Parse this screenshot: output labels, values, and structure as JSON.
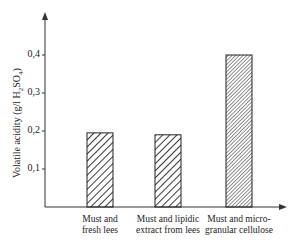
{
  "chart_data": {
    "type": "bar",
    "title": "",
    "xlabel": "",
    "ylabel": "Volatile acidity (g/l H2SO4)",
    "ylabel_parts": {
      "main": "Volatile acidity (g/l H",
      "sub1": "2",
      "mid": "SO",
      "sub2": "4",
      "end": ")"
    },
    "categories": [
      "Must and fresh lees",
      "Must and lipidic extract from lees",
      "Must and micro-granular cellulose"
    ],
    "category_lines": [
      [
        "Must and",
        "fresh lees"
      ],
      [
        "Must and lipidic",
        "extract from lees"
      ],
      [
        "Must and micro-",
        "granular cellulose"
      ]
    ],
    "values": [
      0.195,
      0.19,
      0.4
    ],
    "yticks": [
      "0,1",
      "0,2",
      "0,3",
      "0,4"
    ],
    "ytick_values": [
      0.1,
      0.2,
      0.3,
      0.4
    ],
    "ylim": [
      0,
      0.5
    ],
    "grid": false,
    "legend": null,
    "fill": "hatched"
  }
}
